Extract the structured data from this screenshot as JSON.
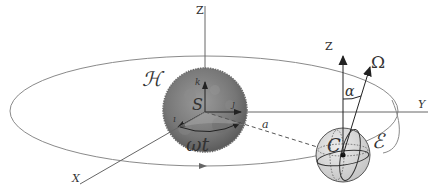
{
  "labels": {
    "sun_z_axis": "Z",
    "x_axis": "X",
    "y_axis": "Y",
    "heliocentric_frame": "ℋ",
    "sun_center": "S",
    "unit_i": "ı",
    "unit_j": "ȷ",
    "unit_k": "k",
    "angle": "ωt",
    "distance": "a",
    "earth_center": "C",
    "earth_frame": "ℰ",
    "earth_z_axis": "Z",
    "rotation_vector": "Ω",
    "tilt_angle": "α"
  },
  "colors": {
    "line": "#6a6a6a",
    "dark": "#222222",
    "sun_fill": "#7a7a7a",
    "earth_fill": "#d8d8d8"
  }
}
